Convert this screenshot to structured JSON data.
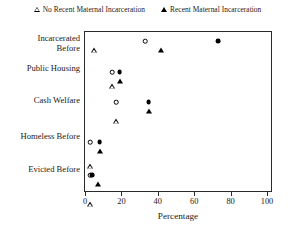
{
  "chart_data": {
    "type": "scatter",
    "title": "",
    "xlabel": "Percentage",
    "ylabel": "",
    "xlim": [
      0,
      100
    ],
    "xticks": [
      0,
      20,
      40,
      60,
      80,
      100
    ],
    "grid": false,
    "legend_position": "top",
    "categories": [
      "Incarcerated Before",
      "Public Housing",
      "Cash Welfare",
      "Homeless Before",
      "Evicted Before"
    ],
    "category_lines": [
      [
        "Incarcerated",
        "Before"
      ],
      [
        "Public Housing"
      ],
      [
        "Cash Welfare"
      ],
      [
        "Homeless Before"
      ],
      [
        "Evicted Before"
      ]
    ],
    "legend": [
      {
        "label": "No Recent Maternal Incarceration",
        "marker": "triangle-open"
      },
      {
        "label": "Recent Maternal Incarceration",
        "marker": "triangle-filled"
      }
    ],
    "series": [
      {
        "name": "No Recent Maternal Incarceration",
        "marker": "open",
        "circle_values": [
          33,
          15,
          17,
          3,
          3
        ],
        "triangle_values": [
          5,
          15,
          17,
          3,
          3
        ]
      },
      {
        "name": "Recent Maternal Incarceration",
        "marker": "filled",
        "circle_values": [
          73,
          19,
          35,
          8,
          4
        ],
        "triangle_values": [
          42,
          19,
          35,
          8,
          7
        ]
      }
    ],
    "points": [
      {
        "category": "Incarcerated Before",
        "group": "No Recent Maternal Incarceration",
        "shape": "circle-open",
        "value": 33
      },
      {
        "category": "Incarcerated Before",
        "group": "Recent Maternal Incarceration",
        "shape": "circle-filled",
        "value": 73
      },
      {
        "category": "Incarcerated Before",
        "group": "No Recent Maternal Incarceration",
        "shape": "triangle-open",
        "value": 5
      },
      {
        "category": "Incarcerated Before",
        "group": "Recent Maternal Incarceration",
        "shape": "triangle-filled",
        "value": 42
      },
      {
        "category": "Public Housing",
        "group": "No Recent Maternal Incarceration",
        "shape": "circle-open",
        "value": 15
      },
      {
        "category": "Public Housing",
        "group": "Recent Maternal Incarceration",
        "shape": "circle-filled",
        "value": 19
      },
      {
        "category": "Public Housing",
        "group": "No Recent Maternal Incarceration",
        "shape": "triangle-open",
        "value": 15
      },
      {
        "category": "Public Housing",
        "group": "Recent Maternal Incarceration",
        "shape": "triangle-filled",
        "value": 19
      },
      {
        "category": "Cash Welfare",
        "group": "No Recent Maternal Incarceration",
        "shape": "circle-open",
        "value": 17
      },
      {
        "category": "Cash Welfare",
        "group": "Recent Maternal Incarceration",
        "shape": "circle-filled",
        "value": 35
      },
      {
        "category": "Cash Welfare",
        "group": "No Recent Maternal Incarceration",
        "shape": "triangle-open",
        "value": 17
      },
      {
        "category": "Cash Welfare",
        "group": "Recent Maternal Incarceration",
        "shape": "triangle-filled",
        "value": 35
      },
      {
        "category": "Homeless Before",
        "group": "No Recent Maternal Incarceration",
        "shape": "circle-open",
        "value": 3
      },
      {
        "category": "Homeless Before",
        "group": "Recent Maternal Incarceration",
        "shape": "circle-filled",
        "value": 8
      },
      {
        "category": "Homeless Before",
        "group": "No Recent Maternal Incarceration",
        "shape": "triangle-open",
        "value": 3
      },
      {
        "category": "Homeless Before",
        "group": "Recent Maternal Incarceration",
        "shape": "triangle-filled",
        "value": 8
      },
      {
        "category": "Evicted Before",
        "group": "No Recent Maternal Incarceration",
        "shape": "circle-open",
        "value": 3
      },
      {
        "category": "Evicted Before",
        "group": "Recent Maternal Incarceration",
        "shape": "circle-filled",
        "value": 4
      },
      {
        "category": "Evicted Before",
        "group": "No Recent Maternal Incarceration",
        "shape": "triangle-open",
        "value": 3
      },
      {
        "category": "Evicted Before",
        "group": "Recent Maternal Incarceration",
        "shape": "triangle-filled",
        "value": 7
      }
    ],
    "colors": {
      "marker": "#000000",
      "axis": "#2a2a2a",
      "background": "#ffffff"
    }
  }
}
